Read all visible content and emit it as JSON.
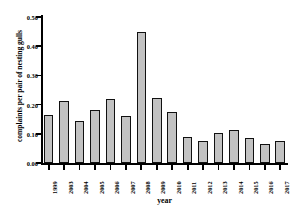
{
  "chart_data": {
    "type": "bar",
    "title": "",
    "xlabel": "year",
    "ylabel": "complaints per pair of nesting gulls",
    "categories": [
      "1999",
      "2003",
      "2004",
      "2005",
      "2006",
      "2007",
      "2008",
      "2009",
      "2010",
      "2011",
      "2012",
      "2013",
      "2014",
      "2015",
      "2016",
      "2017"
    ],
    "values": [
      0.163,
      0.213,
      0.145,
      0.181,
      0.219,
      0.161,
      0.448,
      0.223,
      0.176,
      0.09,
      0.076,
      0.103,
      0.114,
      0.085,
      0.065,
      0.077
    ],
    "ylim": [
      0.0,
      0.5
    ],
    "yticks": [
      0.0,
      0.1,
      0.2,
      0.3,
      0.4,
      0.5
    ],
    "ytick_labels": [
      "0.00",
      "0.10",
      "0.20",
      "0.30",
      "0.40",
      "0.50"
    ],
    "grid": false,
    "legend": "none",
    "bar_fill_color": "#c2c2c2",
    "bar_edge_color": "#111111",
    "axis_color": "#000000",
    "background_color": "#ffffff"
  }
}
